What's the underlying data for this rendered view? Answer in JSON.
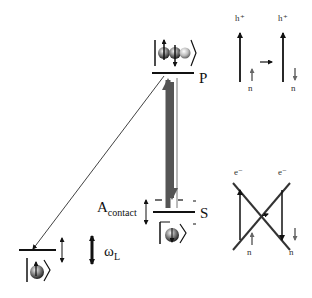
{
  "diagram": {
    "levels": {
      "p": {
        "label": "P"
      },
      "s": {
        "label": "S"
      },
      "ground": {
        "label": ""
      }
    },
    "annotations": {
      "a_contact_main": "A",
      "a_contact_sub": "contact",
      "omega_main": "ω",
      "omega_sub": "L"
    },
    "top_panel": {
      "left_carrier": "h⁺",
      "right_carrier": "h⁺",
      "left_nucleus": "n",
      "right_nucleus": "n"
    },
    "bottom_panel": {
      "left_carrier": "e⁻",
      "right_carrier": "e⁻",
      "left_nucleus": "n",
      "right_nucleus": "n"
    },
    "colors": {
      "line": "#111111",
      "thick_arrow": "#555555",
      "ket_ball": "#777777"
    }
  }
}
